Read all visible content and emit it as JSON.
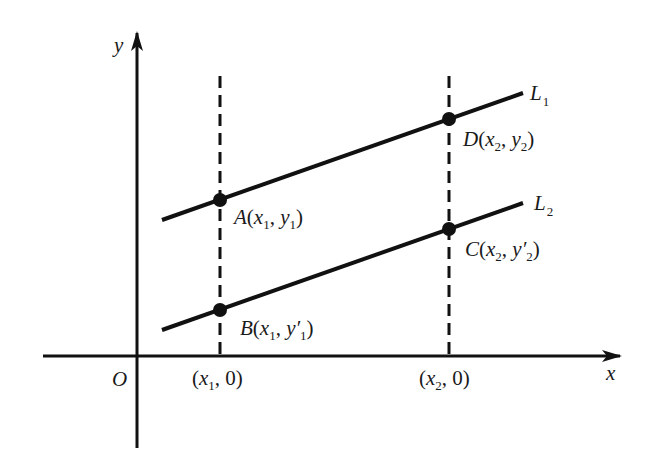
{
  "axes": {
    "x_label": "x",
    "y_label": "y",
    "origin_label": "O"
  },
  "lines": [
    {
      "name": "L",
      "sub": "1"
    },
    {
      "name": "L",
      "sub": "2"
    }
  ],
  "points": {
    "A": {
      "letter": "A",
      "x": "x",
      "xsub": "1",
      "y": "y",
      "prime": "",
      "ysub": "1"
    },
    "B": {
      "letter": "B",
      "x": "x",
      "xsub": "1",
      "y": "y",
      "prime": "′",
      "ysub": "1"
    },
    "C": {
      "letter": "C",
      "x": "x",
      "xsub": "2",
      "y": "y",
      "prime": "′",
      "ysub": "2"
    },
    "D": {
      "letter": "D",
      "x": "x",
      "xsub": "2",
      "y": "y",
      "prime": "",
      "ysub": "2"
    }
  },
  "ticks": [
    {
      "x": "x",
      "sub": "1",
      "zero": "0"
    },
    {
      "x": "x",
      "sub": "2",
      "zero": "0"
    }
  ],
  "punct": {
    "open": "(",
    "close": ")",
    "comma": ", "
  }
}
